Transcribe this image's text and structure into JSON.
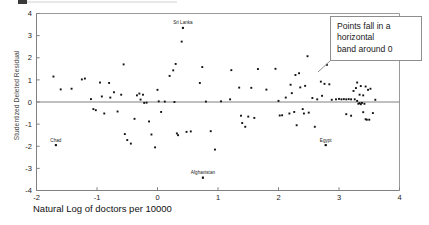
{
  "figure": {
    "name": "residual-scatter-plot",
    "background": "#ffffff",
    "frame_color": "#9a9a9a",
    "point_color": "#111111"
  },
  "annotation": {
    "text": "Points fall in a horizontal band around 0",
    "line_1": "Points fall in a",
    "line_2": "horizontal",
    "line_3": "band around 0",
    "border_color": "#8e8e8e"
  },
  "chart_data": {
    "type": "scatter",
    "title": "",
    "xlabel": "Natural Log of doctors per 10000",
    "ylabel": "Studentized Deleted Residual",
    "xlim": [
      -2,
      4
    ],
    "ylim": [
      -4,
      4
    ],
    "xticks": [
      -2,
      -1,
      0,
      1,
      2,
      3,
      4
    ],
    "xtick_labels": [
      "-2",
      "-1",
      "0",
      "1",
      "2",
      "3",
      "4"
    ],
    "yticks": [
      -4,
      -3,
      -2,
      -1,
      0,
      1,
      2,
      3,
      4
    ],
    "ytick_labels": [
      "-4",
      "-3",
      "-2",
      "-1",
      "0",
      "1",
      "2",
      "3",
      "4"
    ],
    "grid": false,
    "legend": null,
    "reference_lines": [
      {
        "axis": "y",
        "value": 0,
        "color": "#808080"
      }
    ],
    "annotations": [
      {
        "label": "Sri Lanka",
        "x": 0.42,
        "y": 3.35
      },
      {
        "label": "Chad",
        "x": -1.68,
        "y": -1.95
      },
      {
        "label": "Afghanistan",
        "x": 0.75,
        "y": -3.42
      },
      {
        "label": "Egypt",
        "x": 2.78,
        "y": -1.95
      }
    ],
    "points": [
      [
        -1.72,
        1.15
      ],
      [
        -1.6,
        0.57
      ],
      [
        -1.68,
        -1.95
      ],
      [
        -1.42,
        0.6
      ],
      [
        -1.25,
        1.02
      ],
      [
        -1.2,
        1.06
      ],
      [
        -1.1,
        0.13
      ],
      [
        -1.06,
        -0.32
      ],
      [
        -1.02,
        -0.37
      ],
      [
        -0.95,
        0.88
      ],
      [
        -0.92,
        0.25
      ],
      [
        -0.88,
        -0.52
      ],
      [
        -0.8,
        0.86
      ],
      [
        -0.78,
        0.2
      ],
      [
        -0.72,
        0.44
      ],
      [
        -0.66,
        -0.43
      ],
      [
        -0.6,
        0.33
      ],
      [
        -0.56,
        1.7
      ],
      [
        -0.54,
        -1.45
      ],
      [
        -0.5,
        -1.72
      ],
      [
        -0.44,
        -1.88
      ],
      [
        -0.38,
        -0.76
      ],
      [
        -0.34,
        0.3
      ],
      [
        -0.3,
        0.38
      ],
      [
        -0.28,
        0.11
      ],
      [
        -0.24,
        0.33
      ],
      [
        -0.22,
        -0.04
      ],
      [
        -0.18,
        -0.03
      ],
      [
        -0.14,
        -0.88
      ],
      [
        -0.1,
        -1.47
      ],
      [
        -0.04,
        -2.05
      ],
      [
        0.0,
        0.55
      ],
      [
        0.02,
        0.03
      ],
      [
        0.06,
        -0.45
      ],
      [
        0.12,
        0.02
      ],
      [
        0.2,
        1.18
      ],
      [
        0.26,
        1.43
      ],
      [
        0.28,
        0.0
      ],
      [
        0.3,
        1.72
      ],
      [
        0.32,
        -1.42
      ],
      [
        0.34,
        -1.5
      ],
      [
        0.4,
        2.73
      ],
      [
        0.42,
        3.35
      ],
      [
        0.48,
        -1.35
      ],
      [
        0.55,
        -1.33
      ],
      [
        0.7,
        0.86
      ],
      [
        0.74,
        1.58
      ],
      [
        0.75,
        -3.42
      ],
      [
        0.8,
        0.02
      ],
      [
        0.88,
        -1.32
      ],
      [
        0.95,
        -2.15
      ],
      [
        1.05,
        0.03
      ],
      [
        1.2,
        0.12
      ],
      [
        1.22,
        1.44
      ],
      [
        1.35,
        0.65
      ],
      [
        1.38,
        -0.62
      ],
      [
        1.4,
        -0.95
      ],
      [
        1.45,
        -1.12
      ],
      [
        1.5,
        -0.66
      ],
      [
        1.55,
        0.64
      ],
      [
        1.6,
        -0.72
      ],
      [
        1.66,
        1.49
      ],
      [
        1.8,
        0.56
      ],
      [
        1.95,
        1.5
      ],
      [
        2.0,
        0.05
      ],
      [
        2.02,
        -0.61
      ],
      [
        2.06,
        -0.6
      ],
      [
        2.12,
        0.2
      ],
      [
        2.18,
        -0.52
      ],
      [
        2.2,
        0.78
      ],
      [
        2.22,
        0.4
      ],
      [
        2.26,
        -0.45
      ],
      [
        2.28,
        1.22
      ],
      [
        2.3,
        -1.05
      ],
      [
        2.34,
        1.3
      ],
      [
        2.36,
        0.66
      ],
      [
        2.4,
        -0.32
      ],
      [
        2.42,
        -0.52
      ],
      [
        2.44,
        0.73
      ],
      [
        2.48,
        2.07
      ],
      [
        2.5,
        -0.48
      ],
      [
        2.56,
        0.18
      ],
      [
        2.6,
        -1.12
      ],
      [
        2.64,
        0.12
      ],
      [
        2.7,
        0.92
      ],
      [
        2.72,
        0.28
      ],
      [
        2.76,
        0.82
      ],
      [
        2.78,
        -1.95
      ],
      [
        2.8,
        1.68
      ],
      [
        2.84,
        0.8
      ],
      [
        2.88,
        0.1
      ],
      [
        2.95,
        0.12
      ],
      [
        3.0,
        0.14
      ],
      [
        3.04,
        0.12
      ],
      [
        3.08,
        0.13
      ],
      [
        3.12,
        0.12
      ],
      [
        3.16,
        0.13
      ],
      [
        3.2,
        -0.62
      ],
      [
        3.24,
        0.5
      ],
      [
        3.28,
        0.63
      ],
      [
        3.3,
        0.05
      ],
      [
        3.32,
        -0.08
      ],
      [
        3.34,
        -0.05
      ],
      [
        3.34,
        0.33
      ],
      [
        3.36,
        -0.1
      ],
      [
        3.36,
        0.72
      ],
      [
        3.38,
        -0.04
      ],
      [
        3.4,
        -0.46
      ],
      [
        3.4,
        0.3
      ],
      [
        3.42,
        -0.08
      ],
      [
        3.44,
        -0.78
      ],
      [
        3.46,
        -0.8
      ],
      [
        3.48,
        0.55
      ],
      [
        3.5,
        -0.8
      ],
      [
        3.52,
        0.6
      ],
      [
        3.56,
        -0.5
      ],
      [
        3.6,
        0.1
      ],
      [
        3.2,
        0.12
      ],
      [
        3.26,
        0.12
      ],
      [
        3.12,
        -0.55
      ],
      [
        3.44,
        0.7
      ],
      [
        3.3,
        0.88
      ]
    ]
  }
}
